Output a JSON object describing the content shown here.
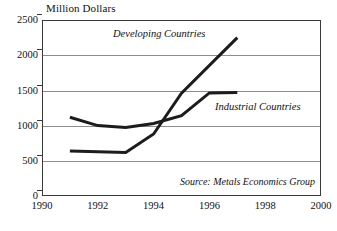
{
  "chart_data": {
    "type": "line",
    "title": "Million Dollars",
    "xlabel": "",
    "ylabel": "Million Dollars",
    "xlim": [
      1990,
      2000
    ],
    "ylim": [
      0,
      2500
    ],
    "xticks": [
      "1990",
      "1992",
      "1994",
      "1996",
      "1998",
      "2000"
    ],
    "xtick_values": [
      1990,
      1992,
      1994,
      1996,
      1998,
      2000
    ],
    "yticks": [
      "0",
      "500",
      "1000",
      "1500",
      "2000",
      "2500"
    ],
    "ytick_values": [
      0,
      500,
      1000,
      1500,
      2000,
      2500
    ],
    "grid": "horizontal",
    "legend_position": "inline-annotation",
    "annotations": [
      {
        "text": "Developing Countries",
        "x": 1992.6,
        "y": 2320
      },
      {
        "text": "Industrial Countries",
        "x": 1996.2,
        "y": 1280
      },
      {
        "text": "Source: Metals Economics Group",
        "x": 1999.0,
        "y": 210
      }
    ],
    "series": [
      {
        "name": "Developing Countries",
        "x": [
          1991,
          1993,
          1994,
          1995,
          1997
        ],
        "values": [
          640,
          620,
          880,
          1460,
          2250
        ]
      },
      {
        "name": "Industrial Countries",
        "x": [
          1991,
          1992,
          1993,
          1994,
          1995,
          1996,
          1997
        ],
        "values": [
          1120,
          1000,
          975,
          1030,
          1140,
          1465,
          1470
        ]
      }
    ]
  },
  "chart": {
    "title": "Million Dollars",
    "source_note": "Source: Metals Economics Group",
    "series_labels": {
      "developing": "Developing Countries",
      "industrial": "Industrial Countries"
    },
    "yticks": {
      "t0": "0",
      "t1": "500",
      "t2": "1000",
      "t3": "1500",
      "t4": "2000",
      "t5": "2500"
    },
    "xticks": {
      "t0": "1990",
      "t1": "1992",
      "t2": "1994",
      "t3": "1996",
      "t4": "1998",
      "t5": "2000"
    },
    "colors": {
      "line": "#1c1c1c",
      "grid": "#8d8d8d",
      "frame": "#3a3a3a",
      "text": "#111111",
      "background": "#ffffff"
    }
  }
}
